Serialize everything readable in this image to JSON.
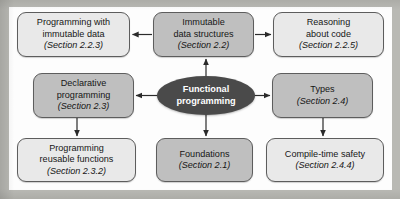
{
  "figure": {
    "center": {
      "line1": "Functional",
      "line2": "programming"
    },
    "nodes": [
      {
        "id": "prog-immutable",
        "line1": "Programming with",
        "line2": "immutable data",
        "section": "(Section 2.2.3)",
        "tone": "light"
      },
      {
        "id": "immutable-ds",
        "line1": "Immutable",
        "line2": "data structures",
        "section": "(Section 2.2)",
        "tone": "mid"
      },
      {
        "id": "reasoning",
        "line1": "Reasoning",
        "line2": "about code",
        "section": "(Section 2.2.5)",
        "tone": "light"
      },
      {
        "id": "declarative",
        "line1": "Declarative",
        "line2": "programming",
        "section": "(Section 2.3)",
        "tone": "mid"
      },
      {
        "id": "types",
        "line1": "Types",
        "line2": "",
        "section": "(Section 2.4)",
        "tone": "mid"
      },
      {
        "id": "reusable",
        "line1": "Programming",
        "line2": "reusable functions",
        "section": "(Section 2.3.2)",
        "tone": "light"
      },
      {
        "id": "foundations",
        "line1": "Foundations",
        "line2": "",
        "section": "(Section 2.1)",
        "tone": "mid"
      },
      {
        "id": "compile-safety",
        "line1": "Compile-time safety",
        "line2": "",
        "section": "(Section 2.4.4)",
        "tone": "light"
      }
    ],
    "edges": [
      {
        "from": "immutable-ds",
        "to": "prog-immutable",
        "direction": "left"
      },
      {
        "from": "immutable-ds",
        "to": "reasoning",
        "direction": "right"
      },
      {
        "from": "core",
        "to": "immutable-ds",
        "direction": "up"
      },
      {
        "from": "core",
        "to": "declarative",
        "direction": "left"
      },
      {
        "from": "core",
        "to": "types",
        "direction": "right"
      },
      {
        "from": "core",
        "to": "foundations",
        "direction": "down"
      },
      {
        "from": "declarative",
        "to": "reusable",
        "direction": "down"
      },
      {
        "from": "types",
        "to": "compile-safety",
        "direction": "down"
      }
    ],
    "colors": {
      "page_border": "#b9b9b4",
      "canvas": "#fdfdfd",
      "node_light": "#e9e9e9",
      "node_mid": "#bfbfbf",
      "center_fill": "#4a4a4a",
      "center_text": "#ffffff",
      "stroke": "#2b2b2b"
    }
  }
}
